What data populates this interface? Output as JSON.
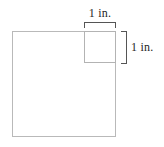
{
  "figure": {
    "type": "geometry-diagram",
    "background_color": "#ffffff",
    "outline_color": "#b9b9b9",
    "bracket_color": "#555555",
    "text_color": "#1f1f1f",
    "shapes": {
      "large_square": {
        "name": "large-square",
        "x": 12,
        "y": 31,
        "width": 104,
        "height": 106
      },
      "unit_square": {
        "name": "unit-square",
        "x": 84,
        "y": 31,
        "width": 32,
        "height": 32
      }
    },
    "measurements": [
      {
        "name": "width-measure",
        "label": "1 in.",
        "orientation": "horizontal",
        "value": 1,
        "unit": "in."
      },
      {
        "name": "height-measure",
        "label": "1 in.",
        "orientation": "vertical",
        "value": 1,
        "unit": "in."
      }
    ]
  }
}
